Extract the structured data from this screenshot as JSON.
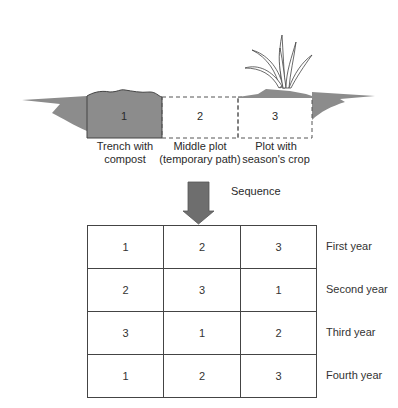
{
  "diagram": {
    "plots": [
      {
        "number": "1",
        "label_line1": "Trench with",
        "label_line2": "compost"
      },
      {
        "number": "2",
        "label_line1": "Middle plot",
        "label_line2": "(temporary path)"
      },
      {
        "number": "3",
        "label_line1": "Plot with",
        "label_line2": "season's crop"
      }
    ],
    "arrow_label": "Sequence",
    "rotation_table": {
      "rows": [
        {
          "cells": [
            "1",
            "2",
            "3"
          ],
          "year": "First year"
        },
        {
          "cells": [
            "2",
            "3",
            "1"
          ],
          "year": "Second year"
        },
        {
          "cells": [
            "3",
            "1",
            "2"
          ],
          "year": "Third year"
        },
        {
          "cells": [
            "1",
            "2",
            "3"
          ],
          "year": "Fourth year"
        }
      ]
    },
    "colors": {
      "soil": "#8c8c8c",
      "outline": "#444444",
      "arrow": "#6e6e6e"
    }
  }
}
